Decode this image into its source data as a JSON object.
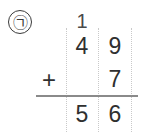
{
  "problem": {
    "marker_label": "㉠",
    "marker_icon": "circled-korean-giyeok-icon",
    "operation": "addition",
    "carry": {
      "tens": "1",
      "ones": ""
    },
    "addend_top": {
      "tens": "4",
      "ones": "9"
    },
    "operator": "+",
    "addend_bottom": {
      "tens": "",
      "ones": "7"
    },
    "sum": {
      "tens": "5",
      "ones": "6"
    },
    "expression": "49 + 7 = 56"
  },
  "style": {
    "ink": "#2f2f2f",
    "rule_color": "#8a8a8a",
    "guide_color": "#c9c9c9",
    "background": "#ffffff"
  }
}
